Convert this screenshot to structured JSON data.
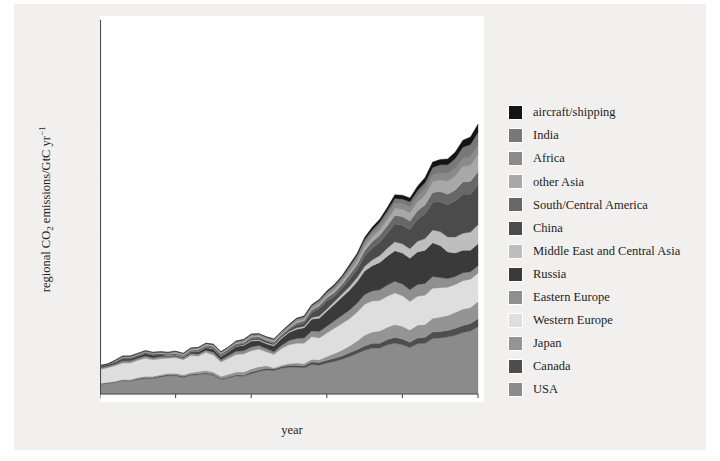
{
  "figure": {
    "background_color": "#f1f0ee",
    "plot_background_color": "#ffffff",
    "axis_color": "#4a4a4a"
  },
  "axes": {
    "xlabel": "year",
    "ylabel_main": "regional CO",
    "ylabel_sub": "2",
    "ylabel_rest": " emissions/GtC yr",
    "ylabel_sup": "−1",
    "xticks": [
      "1900",
      "1920",
      "1940",
      "1960",
      "1980",
      "2000"
    ],
    "yticks": [
      "0",
      "1",
      "2",
      "3",
      "4",
      "5",
      "6",
      "7"
    ]
  },
  "chart_data": {
    "type": "area",
    "title": "",
    "xlabel": "year",
    "ylabel": "regional CO2 emissions/GtC yr-1",
    "xlim": [
      1900,
      2000
    ],
    "ylim": [
      0,
      7
    ],
    "grid": false,
    "legend_position": "right",
    "stacked": true,
    "stack_order_bottom_to_top": [
      "USA",
      "Canada",
      "Japan",
      "Western Europe",
      "Eastern Europe",
      "Russia",
      "Middle East and Central Asia",
      "China",
      "South/Central America",
      "other Asia",
      "Africa",
      "India",
      "aircraft/shipping"
    ],
    "x": [
      1900,
      1902,
      1904,
      1906,
      1908,
      1910,
      1912,
      1914,
      1916,
      1918,
      1920,
      1922,
      1924,
      1926,
      1928,
      1930,
      1932,
      1934,
      1936,
      1938,
      1940,
      1942,
      1944,
      1946,
      1948,
      1950,
      1952,
      1954,
      1956,
      1958,
      1960,
      1962,
      1964,
      1966,
      1968,
      1970,
      1972,
      1974,
      1976,
      1978,
      1980,
      1982,
      1984,
      1986,
      1988,
      1990,
      1992,
      1994,
      1996,
      1998,
      2000
    ],
    "series": [
      {
        "name": "USA",
        "color": "#8b8b8b",
        "values": [
          0.18,
          0.2,
          0.22,
          0.25,
          0.24,
          0.27,
          0.29,
          0.29,
          0.32,
          0.34,
          0.34,
          0.31,
          0.35,
          0.36,
          0.38,
          0.35,
          0.27,
          0.3,
          0.34,
          0.33,
          0.38,
          0.42,
          0.45,
          0.44,
          0.48,
          0.5,
          0.5,
          0.49,
          0.55,
          0.54,
          0.58,
          0.61,
          0.65,
          0.7,
          0.76,
          0.82,
          0.86,
          0.86,
          0.92,
          0.95,
          0.92,
          0.87,
          0.94,
          0.95,
          1.04,
          1.05,
          1.07,
          1.1,
          1.15,
          1.18,
          1.26
        ]
      },
      {
        "name": "Canada",
        "color": "#4e4e4e",
        "values": [
          0.01,
          0.01,
          0.01,
          0.01,
          0.01,
          0.02,
          0.02,
          0.02,
          0.02,
          0.02,
          0.02,
          0.02,
          0.02,
          0.02,
          0.02,
          0.02,
          0.02,
          0.02,
          0.02,
          0.02,
          0.03,
          0.03,
          0.03,
          0.03,
          0.03,
          0.04,
          0.04,
          0.04,
          0.05,
          0.05,
          0.05,
          0.06,
          0.06,
          0.07,
          0.07,
          0.08,
          0.09,
          0.09,
          0.1,
          0.11,
          0.11,
          0.1,
          0.11,
          0.11,
          0.12,
          0.12,
          0.12,
          0.13,
          0.13,
          0.14,
          0.15
        ]
      },
      {
        "name": "Japan",
        "color": "#949494",
        "values": [
          0.01,
          0.01,
          0.01,
          0.01,
          0.02,
          0.02,
          0.02,
          0.02,
          0.02,
          0.03,
          0.03,
          0.03,
          0.03,
          0.04,
          0.04,
          0.04,
          0.04,
          0.05,
          0.05,
          0.06,
          0.06,
          0.06,
          0.05,
          0.02,
          0.03,
          0.03,
          0.04,
          0.04,
          0.05,
          0.05,
          0.07,
          0.09,
          0.11,
          0.13,
          0.16,
          0.2,
          0.21,
          0.23,
          0.23,
          0.24,
          0.24,
          0.23,
          0.24,
          0.24,
          0.26,
          0.27,
          0.28,
          0.3,
          0.31,
          0.3,
          0.32
        ]
      },
      {
        "name": "Western Europe",
        "color": "#dedede",
        "values": [
          0.26,
          0.27,
          0.29,
          0.31,
          0.31,
          0.32,
          0.34,
          0.31,
          0.3,
          0.28,
          0.29,
          0.28,
          0.32,
          0.29,
          0.34,
          0.32,
          0.27,
          0.3,
          0.33,
          0.34,
          0.34,
          0.33,
          0.26,
          0.25,
          0.31,
          0.35,
          0.37,
          0.38,
          0.42,
          0.41,
          0.44,
          0.47,
          0.5,
          0.51,
          0.54,
          0.58,
          0.58,
          0.57,
          0.58,
          0.59,
          0.57,
          0.53,
          0.54,
          0.55,
          0.56,
          0.55,
          0.53,
          0.52,
          0.53,
          0.53,
          0.53
        ]
      },
      {
        "name": "Eastern Europe",
        "color": "#8f8f8f",
        "values": [
          0.03,
          0.03,
          0.03,
          0.04,
          0.04,
          0.04,
          0.04,
          0.04,
          0.04,
          0.03,
          0.03,
          0.03,
          0.04,
          0.04,
          0.04,
          0.05,
          0.04,
          0.05,
          0.06,
          0.06,
          0.07,
          0.07,
          0.06,
          0.05,
          0.06,
          0.08,
          0.09,
          0.1,
          0.11,
          0.12,
          0.13,
          0.14,
          0.15,
          0.16,
          0.17,
          0.18,
          0.19,
          0.2,
          0.21,
          0.22,
          0.22,
          0.22,
          0.22,
          0.22,
          0.22,
          0.19,
          0.16,
          0.15,
          0.15,
          0.14,
          0.14
        ]
      },
      {
        "name": "Russia",
        "color": "#3a3a3a",
        "values": [
          0.03,
          0.03,
          0.03,
          0.04,
          0.04,
          0.04,
          0.05,
          0.05,
          0.04,
          0.02,
          0.02,
          0.02,
          0.03,
          0.04,
          0.05,
          0.06,
          0.06,
          0.07,
          0.09,
          0.1,
          0.11,
          0.09,
          0.09,
          0.11,
          0.13,
          0.15,
          0.17,
          0.19,
          0.22,
          0.25,
          0.28,
          0.31,
          0.34,
          0.37,
          0.4,
          0.44,
          0.47,
          0.51,
          0.54,
          0.57,
          0.58,
          0.59,
          0.61,
          0.62,
          0.63,
          0.6,
          0.5,
          0.44,
          0.42,
          0.4,
          0.41
        ]
      },
      {
        "name": "Middle East and Central Asia",
        "color": "#bebebe",
        "values": [
          0.0,
          0.0,
          0.0,
          0.0,
          0.0,
          0.0,
          0.0,
          0.0,
          0.0,
          0.01,
          0.01,
          0.01,
          0.01,
          0.01,
          0.01,
          0.01,
          0.01,
          0.01,
          0.01,
          0.01,
          0.02,
          0.02,
          0.02,
          0.02,
          0.02,
          0.02,
          0.03,
          0.03,
          0.03,
          0.04,
          0.04,
          0.05,
          0.06,
          0.07,
          0.08,
          0.09,
          0.11,
          0.13,
          0.15,
          0.17,
          0.17,
          0.18,
          0.2,
          0.22,
          0.24,
          0.26,
          0.28,
          0.3,
          0.32,
          0.34,
          0.36
        ]
      },
      {
        "name": "China",
        "color": "#4b4b4b",
        "values": [
          0.0,
          0.0,
          0.01,
          0.01,
          0.01,
          0.01,
          0.01,
          0.01,
          0.01,
          0.01,
          0.01,
          0.01,
          0.01,
          0.01,
          0.01,
          0.02,
          0.02,
          0.02,
          0.02,
          0.02,
          0.03,
          0.03,
          0.03,
          0.02,
          0.02,
          0.03,
          0.05,
          0.06,
          0.09,
          0.14,
          0.15,
          0.1,
          0.11,
          0.14,
          0.15,
          0.19,
          0.22,
          0.25,
          0.28,
          0.33,
          0.35,
          0.36,
          0.41,
          0.46,
          0.52,
          0.56,
          0.6,
          0.67,
          0.73,
          0.71,
          0.74
        ]
      },
      {
        "name": "South/Central America",
        "color": "#676767",
        "values": [
          0.0,
          0.0,
          0.01,
          0.01,
          0.01,
          0.01,
          0.01,
          0.01,
          0.01,
          0.01,
          0.01,
          0.01,
          0.01,
          0.02,
          0.02,
          0.02,
          0.02,
          0.02,
          0.02,
          0.02,
          0.02,
          0.02,
          0.02,
          0.03,
          0.03,
          0.03,
          0.04,
          0.04,
          0.05,
          0.05,
          0.06,
          0.07,
          0.07,
          0.08,
          0.09,
          0.1,
          0.12,
          0.13,
          0.14,
          0.16,
          0.16,
          0.16,
          0.16,
          0.17,
          0.18,
          0.19,
          0.2,
          0.21,
          0.23,
          0.24,
          0.25
        ]
      },
      {
        "name": "other Asia",
        "color": "#a8a8a8",
        "values": [
          0.01,
          0.01,
          0.01,
          0.01,
          0.01,
          0.01,
          0.01,
          0.01,
          0.01,
          0.01,
          0.02,
          0.02,
          0.02,
          0.02,
          0.02,
          0.02,
          0.02,
          0.02,
          0.02,
          0.02,
          0.02,
          0.02,
          0.02,
          0.02,
          0.02,
          0.02,
          0.03,
          0.03,
          0.03,
          0.04,
          0.04,
          0.05,
          0.05,
          0.06,
          0.07,
          0.08,
          0.09,
          0.1,
          0.11,
          0.13,
          0.14,
          0.15,
          0.16,
          0.18,
          0.2,
          0.22,
          0.24,
          0.26,
          0.29,
          0.3,
          0.32
        ]
      },
      {
        "name": "Africa",
        "color": "#8a8a8a",
        "values": [
          0.0,
          0.0,
          0.0,
          0.01,
          0.01,
          0.01,
          0.01,
          0.01,
          0.01,
          0.01,
          0.01,
          0.01,
          0.01,
          0.01,
          0.01,
          0.01,
          0.01,
          0.01,
          0.01,
          0.02,
          0.02,
          0.02,
          0.02,
          0.02,
          0.02,
          0.02,
          0.03,
          0.03,
          0.03,
          0.04,
          0.04,
          0.04,
          0.05,
          0.05,
          0.06,
          0.07,
          0.07,
          0.08,
          0.09,
          0.1,
          0.1,
          0.11,
          0.11,
          0.12,
          0.13,
          0.13,
          0.14,
          0.14,
          0.15,
          0.16,
          0.17
        ]
      },
      {
        "name": "India",
        "color": "#787878",
        "values": [
          0.0,
          0.0,
          0.01,
          0.01,
          0.01,
          0.01,
          0.01,
          0.01,
          0.01,
          0.01,
          0.01,
          0.01,
          0.01,
          0.01,
          0.01,
          0.01,
          0.01,
          0.01,
          0.02,
          0.02,
          0.02,
          0.02,
          0.02,
          0.02,
          0.02,
          0.02,
          0.02,
          0.02,
          0.03,
          0.03,
          0.03,
          0.04,
          0.04,
          0.05,
          0.05,
          0.06,
          0.06,
          0.07,
          0.08,
          0.09,
          0.09,
          0.1,
          0.11,
          0.12,
          0.14,
          0.15,
          0.17,
          0.19,
          0.21,
          0.23,
          0.25
        ]
      },
      {
        "name": "aircraft/shipping",
        "color": "#141414",
        "values": [
          0.0,
          0.0,
          0.0,
          0.0,
          0.0,
          0.0,
          0.0,
          0.0,
          0.0,
          0.0,
          0.0,
          0.0,
          0.0,
          0.0,
          0.0,
          0.0,
          0.0,
          0.0,
          0.0,
          0.0,
          0.0,
          0.0,
          0.0,
          0.0,
          0.0,
          0.01,
          0.01,
          0.01,
          0.01,
          0.01,
          0.02,
          0.02,
          0.02,
          0.03,
          0.03,
          0.04,
          0.05,
          0.05,
          0.06,
          0.07,
          0.07,
          0.07,
          0.08,
          0.09,
          0.1,
          0.1,
          0.11,
          0.12,
          0.13,
          0.14,
          0.15
        ]
      }
    ]
  },
  "legend": {
    "items": [
      {
        "label": "aircraft/shipping",
        "color": "#141414"
      },
      {
        "label": "India",
        "color": "#787878"
      },
      {
        "label": "Africa",
        "color": "#8a8a8a"
      },
      {
        "label": "other Asia",
        "color": "#a8a8a8"
      },
      {
        "label": "South/Central America",
        "color": "#676767"
      },
      {
        "label": "China",
        "color": "#4b4b4b"
      },
      {
        "label": "Middle East and Central Asia",
        "color": "#bebebe"
      },
      {
        "label": "Russia",
        "color": "#3a3a3a"
      },
      {
        "label": "Eastern Europe",
        "color": "#8f8f8f"
      },
      {
        "label": "Western Europe",
        "color": "#dedede"
      },
      {
        "label": "Japan",
        "color": "#949494"
      },
      {
        "label": "Canada",
        "color": "#4e4e4e"
      },
      {
        "label": "USA",
        "color": "#8b8b8b"
      }
    ]
  }
}
